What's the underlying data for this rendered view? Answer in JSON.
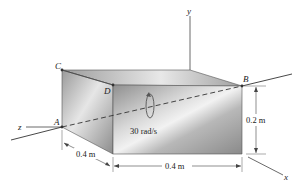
{
  "figure": {
    "points": {
      "A": "A",
      "B": "B",
      "C": "C",
      "D": "D"
    },
    "axes": {
      "x": "x",
      "y": "y",
      "z": "z"
    },
    "angular_velocity": "30 rad/s",
    "dimensions": {
      "depth": "0.4 m",
      "width": "0.4 m",
      "height": "0.2 m"
    },
    "colors": {
      "block_front": "#9a9a9a",
      "block_top": "#a8a8a8",
      "block_side": "#8e8e8e",
      "line": "#333333"
    }
  }
}
